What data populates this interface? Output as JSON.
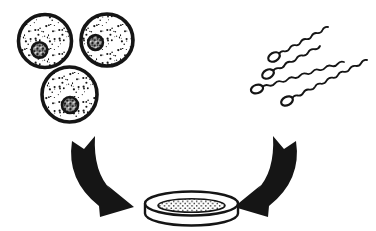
{
  "figure": {
    "kind": "hand-drawn-biology-line-diagram",
    "background_color": "#ffffff",
    "ink_color": "#151515",
    "canvas": {
      "width": 376,
      "height": 231
    }
  },
  "egg_cells": {
    "count": 3,
    "style": {
      "membrane_stroke_width": 3.6,
      "nucleus_stroke_width": 2.6,
      "fill": "sparse-stipple-on-white",
      "nucleus_fill": "dense-dark-mottle"
    },
    "cells": [
      {
        "name": "egg-cell-1",
        "cx": 45,
        "cy": 41,
        "r": 26.5,
        "nucleus": {
          "cx": 39.5,
          "cy": 50,
          "r": 7.8
        }
      },
      {
        "name": "egg-cell-2",
        "cx": 107,
        "cy": 40,
        "r": 26,
        "nucleus": {
          "cx": 95.5,
          "cy": 42.5,
          "r": 7.4
        }
      },
      {
        "name": "egg-cell-3",
        "cx": 69.5,
        "cy": 94.5,
        "r": 27.5,
        "nucleus": {
          "cx": 70,
          "cy": 105,
          "r": 8
        }
      }
    ]
  },
  "sperm_cells": {
    "count": 4,
    "style": {
      "head_rx": 6.2,
      "head_ry": 4.2,
      "head_stroke_width": 2.2,
      "tail_stroke_width": 1.8,
      "wave_amplitude": 2.4,
      "wave_length": 13
    },
    "cells": [
      {
        "name": "sperm-1",
        "head": {
          "cx": 274,
          "cy": 57
        },
        "tail_end": {
          "x": 328,
          "y": 27
        }
      },
      {
        "name": "sperm-2",
        "head": {
          "cx": 268,
          "cy": 74
        },
        "tail_end": {
          "x": 320,
          "y": 46
        }
      },
      {
        "name": "sperm-3",
        "head": {
          "cx": 257,
          "cy": 89
        },
        "tail_end": {
          "x": 344,
          "y": 62
        }
      },
      {
        "name": "sperm-4",
        "head": {
          "cx": 287,
          "cy": 101
        },
        "tail_end": {
          "x": 367,
          "y": 60
        }
      }
    ]
  },
  "arrows": {
    "style": {
      "fill": "solid-black",
      "tail": "swallowtail-notch",
      "head": "broad-barbed-triangle"
    },
    "left": {
      "name": "left-arrow",
      "direction": "curves-down-right-into-dish",
      "d": "M 72,141 Q 66,180 99,206 L 100,217 L 134,207 L 107,185 L 111,190 Q 93,172 95,136 L 84,149 Z"
    },
    "right": {
      "name": "right-arrow",
      "direction": "curves-down-left-into-dish",
      "mirror_axis_x": 184
    }
  },
  "petri_dish": {
    "name": "petri-dish",
    "cx": 191.5,
    "rim_cy": 203.5,
    "rx": 46.5,
    "ry": 12,
    "wall_drop": 10,
    "stroke_width": 2.4,
    "medium": {
      "cx": 191.5,
      "cy": 205.5,
      "rx": 33.5,
      "ry": 6.8,
      "stroke_width": 1.6,
      "fill": "fine-dot-mesh"
    }
  }
}
